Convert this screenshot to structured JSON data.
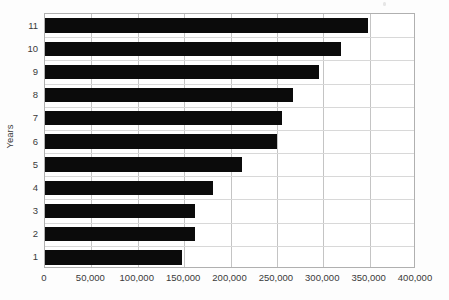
{
  "chart_data": {
    "type": "bar",
    "orientation": "horizontal",
    "title": "",
    "xlabel": "",
    "ylabel": "Years",
    "categories": [
      "1",
      "2",
      "3",
      "4",
      "5",
      "6",
      "7",
      "8",
      "9",
      "10",
      "11"
    ],
    "values": [
      148000,
      162000,
      162000,
      181000,
      212000,
      250000,
      255000,
      267000,
      295000,
      319000,
      348000
    ],
    "xlim": [
      0,
      400000
    ],
    "xticks": [
      0,
      50000,
      100000,
      150000,
      200000,
      250000,
      300000,
      350000,
      400000
    ],
    "xtick_labels": [
      "0",
      "50,000",
      "100,000",
      "150,000",
      "200,000",
      "250,000",
      "300,000",
      "350,000",
      "400,000"
    ],
    "ytick_labels": [
      "1",
      "2",
      "3",
      "4",
      "5",
      "6",
      "7",
      "8",
      "9",
      "10",
      "11"
    ],
    "grid": true,
    "grid_axis": "both",
    "legend": false,
    "bar_color": "#0b0b0b",
    "plot_border_color": "#b0b0b0",
    "grid_color": "#c4c4c4"
  }
}
